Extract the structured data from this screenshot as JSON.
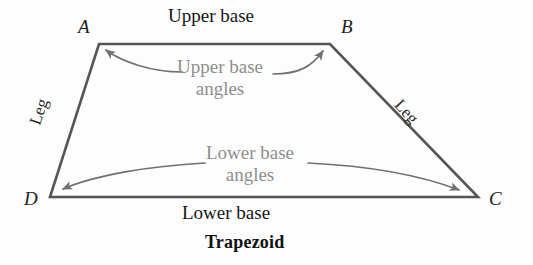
{
  "figure": {
    "caption": "Trapezoid",
    "shape_name": "trapezoid",
    "background_color": "#fdfdfd",
    "outline_color": "#555555",
    "annotation_color": "#8e8e8e",
    "arrow_color": "#707070"
  },
  "vertices": {
    "a": "A",
    "b": "B",
    "c": "C",
    "d": "D"
  },
  "labels": {
    "upper_base": "Upper base",
    "lower_base": "Lower base",
    "leg_left": "Leg",
    "leg_right": "Leg"
  },
  "annotations": {
    "upper_base_angles_line1": "Upper base",
    "upper_base_angles_line2": "angles",
    "lower_base_angles_line1": "Lower base",
    "lower_base_angles_line2": "angles"
  }
}
